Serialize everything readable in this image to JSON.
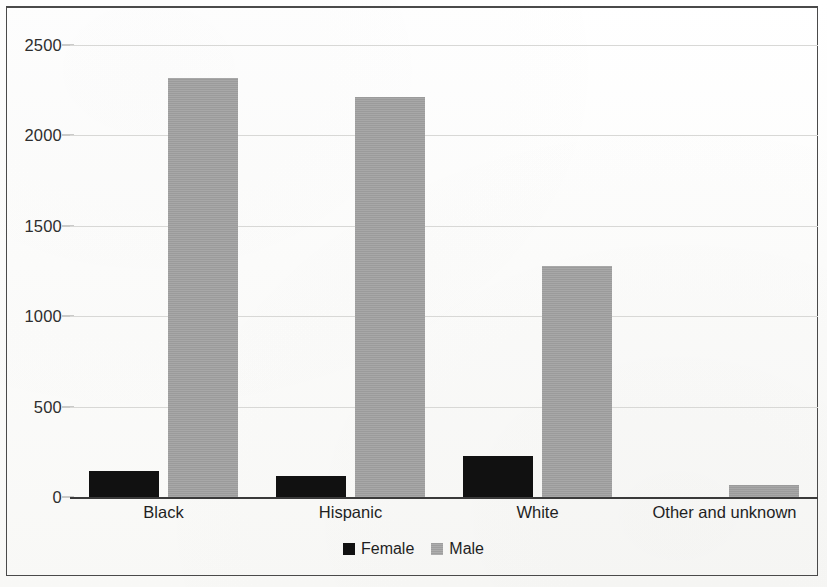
{
  "chart_data": {
    "type": "bar",
    "title": "",
    "subtitle": "",
    "xlabel": "",
    "ylabel": "",
    "categories": [
      "Black",
      "Hispanic",
      "White",
      "Other and unknown"
    ],
    "series": [
      {
        "name": "Female",
        "color": "#111111",
        "values": [
          145,
          115,
          228,
          0
        ]
      },
      {
        "name": "Male",
        "color": "#a3a3a3",
        "values": [
          2320,
          2215,
          1280,
          65
        ]
      }
    ],
    "ylim": [
      0,
      2500
    ],
    "yticks": [
      0,
      500,
      1000,
      1500,
      2000,
      2500
    ],
    "ytick_labels": [
      "0",
      "500",
      "1000",
      "1500",
      "2000",
      "2500"
    ],
    "grid": true,
    "grid_axis": "y",
    "legend": [
      "Female",
      "Male"
    ],
    "legend_position": "bottom-center",
    "bar_grouping": "grouped",
    "annotations": []
  },
  "legend": {
    "items": [
      {
        "label": "Female",
        "swatch": "black-square-swatch"
      },
      {
        "label": "Male",
        "swatch": "gray-square-swatch"
      }
    ]
  },
  "frame": {
    "border_color": "#4a4a4a",
    "background": "#fdfdfc"
  }
}
